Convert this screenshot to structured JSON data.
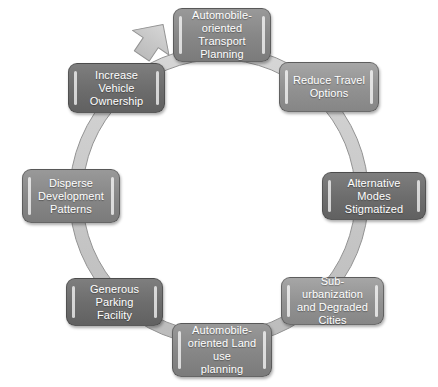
{
  "diagram": {
    "type": "cycle",
    "direction": "clockwise",
    "ring": {
      "fill_color": "#c9c9c9",
      "stroke_color": "#8c8c8c",
      "center_color": "#ffffff",
      "arrow_count": 1,
      "arrow_position": "top-left"
    },
    "nodes": [
      {
        "id": "automobile-oriented-transport-planning",
        "label": "Automobile-\noriented Transport\nPlanning",
        "position": "top",
        "shade": "shade-mid",
        "color": "#868686"
      },
      {
        "id": "reduce-travel-options",
        "label": "Reduce Travel\nOptions",
        "position": "top-right",
        "shade": "shade-light",
        "color": "#919191"
      },
      {
        "id": "alternative-modes-stigmatized",
        "label": "Alternative Modes\nStigmatized",
        "position": "right",
        "shade": "shade-dark",
        "color": "#6c6c6c"
      },
      {
        "id": "sub-urbanization-and-degraded-cities",
        "label": "Sub-urbanization\nand Degraded Cities",
        "position": "bottom-right",
        "shade": "shade-light",
        "color": "#919191"
      },
      {
        "id": "automobile-oriented-land-use-planning",
        "label": "Automobile-\noriented Land use\nplanning",
        "position": "bottom",
        "shade": "shade-mid",
        "color": "#868686"
      },
      {
        "id": "generous-parking-facility",
        "label": "Generous Parking\nFacility",
        "position": "bottom-left",
        "shade": "shade-dark",
        "color": "#6c6c6c"
      },
      {
        "id": "disperse-development-patterns",
        "label": "Disperse\nDevelopment\nPatterns",
        "position": "left",
        "shade": "shade-mid",
        "color": "#868686"
      },
      {
        "id": "increase-vehicle-ownership",
        "label": "Increase Vehicle\nOwnership",
        "position": "top-left",
        "shade": "shade-dark",
        "color": "#6c6c6c"
      }
    ]
  }
}
